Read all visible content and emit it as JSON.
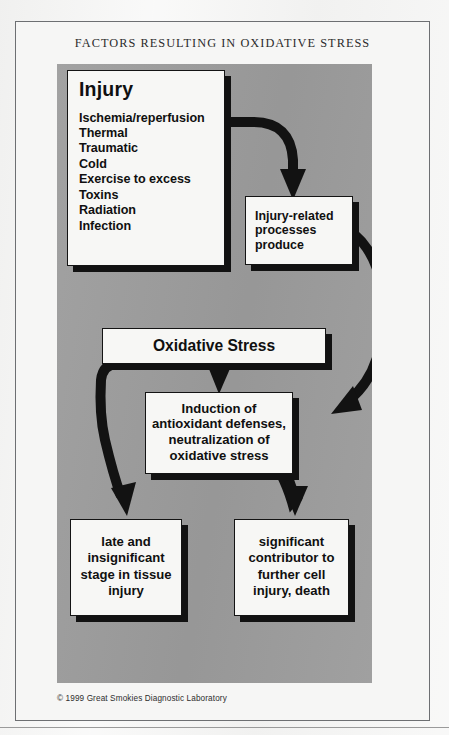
{
  "figure": {
    "title": "FACTORS RESULTING IN OXIDATIVE STRESS",
    "copyright": "© 1999 Great Smokies Diagnostic Laboratory",
    "panel_color": "#9d9d9d",
    "box_fill": "#f7f7f5",
    "ink_color": "#121212",
    "page_background": "#f4f4f3"
  },
  "nodes": {
    "injury": {
      "heading": "Injury",
      "items": [
        "Ischemia/reperfusion",
        "Thermal",
        "Traumatic",
        "Cold",
        "Exercise to excess",
        "Toxins",
        "Radiation",
        "Infection"
      ]
    },
    "injury_related": {
      "lines": [
        "Injury-related",
        "processes",
        "produce"
      ]
    },
    "oxidative_stress": {
      "label": "Oxidative Stress"
    },
    "induction": {
      "lines": [
        "Induction of",
        "antioxidant defenses,",
        "neutralization of",
        "oxidative stress"
      ]
    },
    "late_insignificant": {
      "lines": [
        "late and",
        "insignificant",
        "stage in tissue",
        "injury"
      ]
    },
    "significant_contributor": {
      "lines": [
        "significant",
        "contributor to",
        "further cell",
        "injury, death"
      ]
    }
  },
  "arrows": [
    {
      "name": "injury-to-injury-related",
      "from": "injury",
      "to": "injury_related",
      "style": "curved-elbow"
    },
    {
      "name": "injury-related-to-induction",
      "from": "injury_related",
      "to": "induction",
      "style": "long-curve"
    },
    {
      "name": "oxidative-stress-to-induction",
      "from": "oxidative_stress",
      "to": "induction",
      "style": "short-down"
    },
    {
      "name": "oxidative-stress-to-late-insignificant",
      "from": "oxidative_stress",
      "to": "late_insignificant",
      "style": "wavy-down"
    },
    {
      "name": "induction-to-significant-contributor",
      "from": "induction",
      "to": "significant_contributor",
      "style": "curved-down"
    }
  ]
}
